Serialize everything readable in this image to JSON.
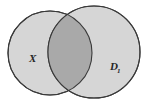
{
  "figure": {
    "kind": "venn-diagram",
    "background_color": "#ffffff",
    "width": 148,
    "height": 104
  },
  "sets": [
    {
      "id": "left",
      "label": "X",
      "subscript": "",
      "fill_color": "#d6d6d6",
      "stroke_color": "#3a3a3a",
      "cx": 50,
      "cy": 53,
      "r": 42,
      "label_x": 29,
      "label_y": 62
    },
    {
      "id": "right",
      "label": "D",
      "subscript": "1",
      "fill_color": "#d6d6d6",
      "stroke_color": "#3a3a3a",
      "cx": 94,
      "cy": 52,
      "r": 46,
      "label_x": 110,
      "label_y": 70
    }
  ],
  "intersection": {
    "label": "",
    "fill_color": "#a9a9a9",
    "stroke_color": "#3a3a3a"
  },
  "style": {
    "stroke_width": 1.1,
    "label_font_size": 11,
    "subscript_font_size": 7
  }
}
